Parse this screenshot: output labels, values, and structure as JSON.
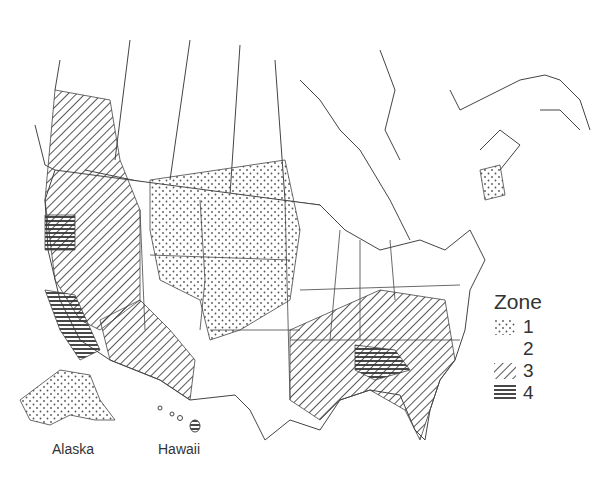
{
  "map": {
    "region": "United States and southern Canada",
    "insets": [
      "Alaska",
      "Hawaii"
    ]
  },
  "labels": {
    "alaska": "Alaska",
    "hawaii": "Hawaii"
  },
  "legend": {
    "title": "Zone",
    "items": [
      {
        "label": "1",
        "pattern": "dots"
      },
      {
        "label": "2",
        "pattern": "blank"
      },
      {
        "label": "3",
        "pattern": "diagonal-hatch"
      },
      {
        "label": "4",
        "pattern": "horizontal-lines"
      }
    ]
  },
  "colors": {
    "line": "#444444",
    "background": "#ffffff"
  }
}
